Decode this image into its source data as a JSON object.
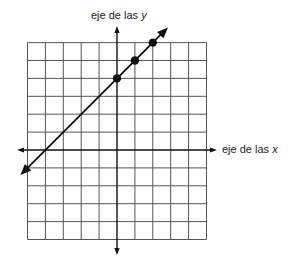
{
  "chart_data": {
    "type": "line",
    "title": "",
    "xlabel": "eje de las x",
    "ylabel": "eje de las y",
    "xlabel_prefix": "eje de las",
    "xlabel_var": "x",
    "ylabel_prefix": "eje de las",
    "ylabel_var": "y",
    "grid": true,
    "xlim": [
      -5,
      5
    ],
    "ylim": [
      -5,
      6
    ],
    "tick_labels_shown": false,
    "series": [
      {
        "name": "line",
        "equation": "y = x + 4",
        "slope": 1,
        "intercept": 4,
        "marked_points": [
          [
            0,
            4
          ],
          [
            1,
            5
          ],
          [
            2,
            6
          ]
        ],
        "extends_with_arrows": true,
        "x_range_drawn": [
          -5.4,
          2.85
        ]
      }
    ],
    "colors": {
      "grid": "#555555",
      "axis": "#111111",
      "line": "#111111"
    }
  }
}
